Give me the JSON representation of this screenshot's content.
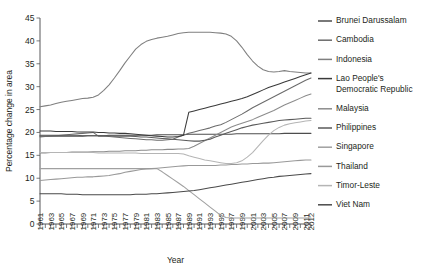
{
  "chart_data": {
    "type": "line",
    "title": "",
    "xlabel": "Year",
    "ylabel": "Percentage change in area",
    "ylim": [
      0,
      45
    ],
    "ytick_step": 5,
    "yticks": [
      0,
      5,
      10,
      15,
      20,
      25,
      30,
      35,
      40,
      45
    ],
    "xlim": [
      1961,
      2012
    ],
    "grid": false,
    "legend_position": "right",
    "xticks": [
      1961,
      1963,
      1965,
      1967,
      1969,
      1971,
      1973,
      1975,
      1977,
      1979,
      1981,
      1983,
      1985,
      1987,
      1989,
      1991,
      1993,
      1995,
      1997,
      1999,
      2001,
      2003,
      2005,
      2007,
      2009,
      2011,
      2012
    ],
    "x": [
      1961,
      1962,
      1963,
      1964,
      1965,
      1966,
      1967,
      1968,
      1969,
      1970,
      1971,
      1972,
      1973,
      1974,
      1975,
      1976,
      1977,
      1978,
      1979,
      1980,
      1981,
      1982,
      1983,
      1984,
      1985,
      1986,
      1987,
      1988,
      1989,
      1990,
      1991,
      1992,
      1993,
      1994,
      1995,
      1996,
      1997,
      1998,
      1999,
      2000,
      2001,
      2002,
      2003,
      2004,
      2005,
      2006,
      2007,
      2008,
      2009,
      2010,
      2011,
      2012
    ],
    "series": [
      {
        "name": "Brunei Darussalam",
        "color": "#4d4d4d",
        "values": [
          19.2,
          19.2,
          19.2,
          19.2,
          19.2,
          19.2,
          19.2,
          19.2,
          19.2,
          19.3,
          19.3,
          19.3,
          19.3,
          19.4,
          19.4,
          19.4,
          19.4,
          19.4,
          19.4,
          19.4,
          19.4,
          19.4,
          19.5,
          19.5,
          19.5,
          19.5,
          19.5,
          19.5,
          19.6,
          19.6,
          19.6,
          19.6,
          19.6,
          19.6,
          19.6,
          19.6,
          19.6,
          19.7,
          19.7,
          19.7,
          19.7,
          19.7,
          19.7,
          19.7,
          19.7,
          19.7,
          19.8,
          19.8,
          19.8,
          19.8,
          19.8,
          19.8
        ]
      },
      {
        "name": "Cambodia",
        "color": "#6b6b6b",
        "values": [
          19.0,
          19.1,
          19.2,
          19.3,
          19.4,
          19.5,
          19.6,
          19.7,
          19.8,
          19.9,
          20.0,
          19.2,
          19.2,
          19.1,
          19.0,
          18.9,
          18.8,
          18.7,
          18.6,
          18.5,
          18.4,
          18.4,
          18.3,
          18.3,
          18.4,
          18.5,
          19.0,
          19.4,
          19.8,
          20.1,
          20.4,
          20.7,
          21.0,
          21.4,
          21.7,
          22.2,
          22.8,
          23.4,
          24.0,
          24.7,
          25.4,
          26.0,
          26.6,
          27.2,
          27.8,
          28.4,
          29.0,
          29.6,
          30.2,
          30.8,
          31.4,
          31.9
        ]
      },
      {
        "name": "Indonesia",
        "color": "#7f7f7f",
        "values": [
          25.6,
          25.8,
          26.0,
          26.3,
          26.6,
          26.8,
          27.0,
          27.2,
          27.4,
          27.5,
          27.7,
          28.2,
          29.2,
          30.4,
          31.9,
          33.5,
          35.2,
          36.7,
          38.2,
          39.2,
          39.9,
          40.3,
          40.6,
          40.8,
          41.0,
          41.3,
          41.6,
          41.8,
          41.9,
          41.9,
          41.9,
          41.9,
          41.9,
          41.8,
          41.7,
          41.5,
          41.0,
          40.0,
          38.6,
          37.0,
          35.6,
          34.5,
          33.7,
          33.3,
          33.2,
          33.3,
          33.5,
          33.3,
          33.2,
          33.1,
          33.0,
          33.0
        ]
      },
      {
        "name": "Lao People's Democratic Republic",
        "color": "#3a3a3a",
        "values": [
          20.3,
          20.3,
          20.3,
          20.2,
          20.2,
          20.2,
          20.2,
          20.1,
          20.1,
          20.1,
          20.1,
          20.0,
          20.0,
          19.9,
          19.9,
          19.8,
          19.8,
          19.7,
          19.6,
          19.5,
          19.4,
          19.3,
          19.2,
          19.1,
          19.0,
          19.0,
          19.1,
          19.4,
          24.4,
          24.7,
          25.0,
          25.3,
          25.6,
          25.9,
          26.2,
          26.5,
          26.8,
          27.1,
          27.4,
          27.8,
          28.3,
          28.8,
          29.3,
          29.8,
          30.2,
          30.6,
          31.0,
          31.4,
          31.8,
          32.2,
          32.6,
          33.0
        ]
      },
      {
        "name": "Malaysia",
        "color": "#8c8c8c",
        "values": [
          15.5,
          15.5,
          15.6,
          15.6,
          15.6,
          15.6,
          15.7,
          15.7,
          15.7,
          15.7,
          15.8,
          15.8,
          15.8,
          15.9,
          15.9,
          15.9,
          16.0,
          16.0,
          16.0,
          16.1,
          16.1,
          16.2,
          16.2,
          16.2,
          16.3,
          16.3,
          16.4,
          16.4,
          16.5,
          17.0,
          17.6,
          18.2,
          18.8,
          19.4,
          20.0,
          20.6,
          21.2,
          21.6,
          22.0,
          22.4,
          22.8,
          23.3,
          23.8,
          24.3,
          24.8,
          25.4,
          26.0,
          26.5,
          27.0,
          27.5,
          28.0,
          28.4
        ]
      },
      {
        "name": "Philippines",
        "color": "#5a5a5a",
        "values": [
          19.4,
          19.4,
          19.4,
          19.4,
          19.4,
          19.4,
          19.4,
          19.4,
          19.3,
          19.3,
          19.3,
          19.3,
          19.3,
          19.3,
          19.2,
          19.2,
          19.2,
          19.2,
          19.1,
          19.0,
          19.0,
          18.9,
          18.8,
          18.7,
          18.6,
          18.5,
          18.4,
          18.3,
          18.2,
          18.1,
          18.1,
          18.3,
          18.5,
          19.0,
          19.4,
          19.8,
          20.2,
          20.6,
          21.0,
          21.3,
          21.6,
          21.8,
          22.0,
          22.2,
          22.4,
          22.6,
          22.7,
          22.8,
          22.9,
          23.0,
          23.1,
          23.1
        ]
      },
      {
        "name": "Singapore",
        "color": "#a0a0a0",
        "values": [
          12.1,
          12.1,
          12.1,
          12.1,
          12.1,
          12.1,
          12.1,
          12.1,
          12.1,
          12.1,
          12.1,
          12.1,
          12.1,
          12.1,
          12.1,
          12.1,
          12.1,
          12.1,
          12.1,
          12.1,
          12.1,
          12.1,
          12.1,
          11.4,
          10.6,
          9.8,
          9.0,
          8.2,
          7.3,
          6.4,
          5.5,
          4.6,
          3.7,
          2.8,
          1.9,
          1.4,
          1.3,
          1.3,
          1.3,
          1.3,
          1.3,
          1.3,
          1.3,
          1.3,
          1.3,
          1.3,
          1.3,
          1.3,
          1.3,
          1.3,
          1.3,
          1.3
        ]
      },
      {
        "name": "Thailand",
        "color": "#999999",
        "values": [
          9.5,
          9.6,
          9.7,
          9.8,
          9.9,
          10.0,
          10.1,
          10.2,
          10.2,
          10.3,
          10.3,
          10.4,
          10.5,
          10.6,
          10.8,
          11.0,
          11.3,
          11.5,
          11.7,
          11.9,
          12.0,
          12.1,
          12.2,
          12.3,
          12.4,
          12.5,
          12.6,
          12.7,
          12.8,
          12.8,
          12.8,
          12.8,
          12.8,
          12.8,
          12.9,
          12.9,
          13.0,
          13.0,
          13.1,
          13.1,
          13.2,
          13.2,
          13.3,
          13.3,
          13.4,
          13.5,
          13.6,
          13.7,
          13.8,
          13.9,
          14.0,
          14.0
        ]
      },
      {
        "name": "Timor-Leste",
        "color": "#b5b5b5",
        "values": [
          15.6,
          15.6,
          15.6,
          15.6,
          15.6,
          15.6,
          15.6,
          15.6,
          15.6,
          15.6,
          15.6,
          15.5,
          15.5,
          15.5,
          15.5,
          15.5,
          15.5,
          15.5,
          15.5,
          15.4,
          15.4,
          15.4,
          15.4,
          15.4,
          15.4,
          15.4,
          15.4,
          15.3,
          14.9,
          14.6,
          14.3,
          14.0,
          13.8,
          13.6,
          13.4,
          13.2,
          13.2,
          13.4,
          13.8,
          14.6,
          15.6,
          16.9,
          18.2,
          19.4,
          20.4,
          21.1,
          21.6,
          21.9,
          22.1,
          22.3,
          22.5,
          22.6
        ]
      },
      {
        "name": "Viet Nam",
        "color": "#4a4a4a",
        "values": [
          6.6,
          6.6,
          6.6,
          6.6,
          6.6,
          6.5,
          6.5,
          6.5,
          6.4,
          6.4,
          6.4,
          6.4,
          6.4,
          6.4,
          6.4,
          6.4,
          6.4,
          6.4,
          6.5,
          6.5,
          6.5,
          6.6,
          6.6,
          6.7,
          6.8,
          6.9,
          7.0,
          7.1,
          7.2,
          7.3,
          7.5,
          7.7,
          7.9,
          8.1,
          8.3,
          8.5,
          8.7,
          8.9,
          9.1,
          9.3,
          9.5,
          9.7,
          9.9,
          10.1,
          10.2,
          10.4,
          10.5,
          10.6,
          10.7,
          10.8,
          10.9,
          11.0
        ]
      }
    ],
    "legend": [
      {
        "label": "Brunei Darussalam",
        "color": "#4d4d4d"
      },
      {
        "label": "Cambodia",
        "color": "#6b6b6b"
      },
      {
        "label": "Indonesia",
        "color": "#7f7f7f"
      },
      {
        "label": "Lao People's",
        "label2": "Democratic Republic",
        "color": "#3a3a3a"
      },
      {
        "label": "Malaysia",
        "color": "#8c8c8c"
      },
      {
        "label": "Philippines",
        "color": "#5a5a5a"
      },
      {
        "label": "Singapore",
        "color": "#a0a0a0"
      },
      {
        "label": "Thailand",
        "color": "#999999"
      },
      {
        "label": "Timor-Leste",
        "color": "#b5b5b5"
      },
      {
        "label": "Viet Nam",
        "color": "#4a4a4a"
      }
    ]
  }
}
